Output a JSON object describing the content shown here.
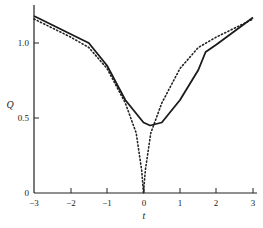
{
  "chart_data": {
    "type": "line",
    "title": "",
    "xlabel": "t",
    "ylabel": "Q",
    "xlim": [
      -3,
      3
    ],
    "ylim": [
      0,
      1.2
    ],
    "x_ticks": [
      "-3",
      "-2",
      "-1",
      "0",
      "1",
      "2",
      "3"
    ],
    "y_ticks": [
      "0",
      "0.5",
      "1.0"
    ],
    "grid": false,
    "legend": null,
    "series": [
      {
        "name": "solid",
        "style": "solid",
        "x": [
          -3,
          -2.5,
          -2,
          -1.5,
          -1,
          -0.5,
          0,
          0.18,
          0.5,
          1,
          1.5,
          1.7,
          2,
          2.5,
          3
        ],
        "y": [
          1.18,
          1.12,
          1.06,
          1.0,
          0.85,
          0.62,
          0.47,
          0.45,
          0.47,
          0.62,
          0.82,
          0.94,
          0.99,
          1.08,
          1.17
        ]
      },
      {
        "name": "dotted",
        "style": "dotted",
        "x": [
          -3,
          -2.5,
          -2,
          -1.5,
          -1,
          -0.5,
          -0.2,
          -0.05,
          0,
          0.05,
          0.2,
          0.5,
          1,
          1.5,
          2,
          2.5,
          3
        ],
        "y": [
          1.16,
          1.1,
          1.04,
          0.97,
          0.83,
          0.6,
          0.4,
          0.15,
          0.0,
          0.15,
          0.4,
          0.6,
          0.83,
          0.97,
          1.04,
          1.1,
          1.16
        ]
      }
    ]
  },
  "labels": {
    "xlabel": "t",
    "ylabel": "Q",
    "x_ticks": [
      "−3",
      "−2",
      "−1",
      "0",
      "1",
      "2",
      "3"
    ],
    "y_ticks": [
      "0",
      "0.5",
      "1.0"
    ]
  }
}
